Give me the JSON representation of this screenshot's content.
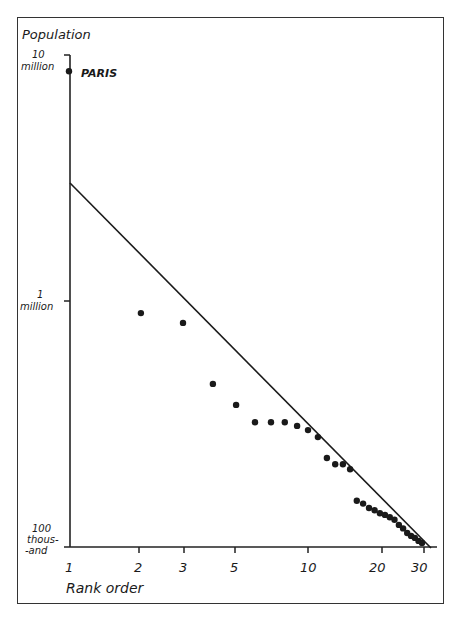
{
  "chart_data": {
    "type": "scatter",
    "title": "",
    "xlabel": "Rank order",
    "ylabel": "Population",
    "x_scale": "log",
    "y_scale": "log",
    "x_ticks": [
      1,
      2,
      3,
      5,
      10,
      20,
      30
    ],
    "x_tick_labels": [
      "1",
      "2",
      "3",
      "5",
      "10",
      "20",
      "30"
    ],
    "y_ticks": [
      100000,
      1000000,
      10000000
    ],
    "y_tick_labels": [
      [
        "100",
        "thous-",
        "-and"
      ],
      [
        "1",
        "million"
      ],
      [
        "10",
        "million"
      ]
    ],
    "xlim": [
      1,
      33
    ],
    "ylim": [
      100000,
      10000000
    ],
    "grid": false,
    "legend": null,
    "annotations": [
      {
        "text": "PARIS",
        "x": 1,
        "y": 8900000
      }
    ],
    "series": [
      {
        "name": "French cities",
        "x": [
          1,
          2,
          3,
          4,
          5,
          6,
          7,
          8,
          9,
          10,
          11,
          12,
          13,
          14,
          15,
          16,
          17,
          18,
          19,
          20,
          21,
          22,
          23,
          24,
          25,
          26,
          27,
          28,
          29,
          30
        ],
        "values": [
          8900000,
          900000,
          820000,
          460000,
          377000,
          320000,
          320000,
          320000,
          309000,
          297000,
          278000,
          228000,
          215000,
          215000,
          205000,
          152000,
          148000,
          142000,
          139000,
          135000,
          133000,
          130000,
          127000,
          121000,
          117000,
          112000,
          109000,
          107000,
          104000,
          102000
        ]
      },
      {
        "name": "Rank-size rule line",
        "type": "line",
        "x": [
          1,
          32
        ],
        "values": [
          3100000,
          100000
        ]
      }
    ]
  },
  "labels": {
    "ylabel": "Population",
    "xlabel": "Rank order",
    "paris": "PARIS",
    "y10m_a": "10",
    "y10m_b": "million",
    "y1m_a": "1",
    "y1m_b": "million",
    "y100k_a": "100",
    "y100k_b": "thous-",
    "y100k_c": "-and",
    "x1": "1",
    "x2": "2",
    "x3": "3",
    "x5": "5",
    "x10": "10",
    "x20": "20",
    "x30": "30"
  }
}
